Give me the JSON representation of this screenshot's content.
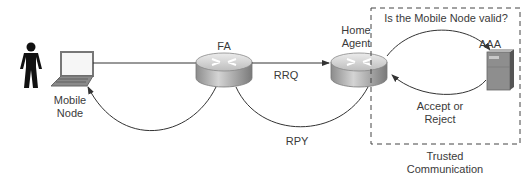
{
  "nodes": {
    "user": {
      "label": "",
      "icon": "person-icon"
    },
    "mobile_node": {
      "label_line1": "Mobile",
      "label_line2": "Node",
      "icon": "laptop-icon"
    },
    "fa": {
      "label": "FA",
      "icon": "router-icon"
    },
    "home_agent": {
      "label_line1": "Home",
      "label_line2": "Agent",
      "icon": "router-icon"
    },
    "aaa": {
      "label": "AAA",
      "icon": "server-icon"
    }
  },
  "messages": {
    "rrq": "RRQ",
    "rpy": "RPY",
    "validation_question": "Is the Mobile Node valid?",
    "accept_line1": "Accept or",
    "accept_line2": "Reject"
  },
  "trusted_zone": {
    "label_line1": "Trusted",
    "label_line2": "Communication"
  },
  "colors": {
    "line": "#333333",
    "router_top": "#d8d8d8",
    "router_side": "#a8a8a8",
    "server": "#8a8a8a",
    "person": "#111111"
  }
}
